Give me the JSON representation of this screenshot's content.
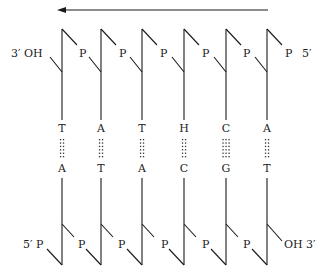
{
  "diagram": {
    "arrow": {
      "direction": "right-to-left",
      "x1": 268,
      "x2": 60,
      "y": 10
    },
    "colors": {
      "ink": "#1a1a1a",
      "background": "#ffffff"
    },
    "top_strand": {
      "left_end_label": "3′ OH",
      "right_end_label": "5′",
      "phosphate_label": "P",
      "phosphates_count": 6,
      "bases": [
        "T",
        "A",
        "T",
        "H",
        "C",
        "A"
      ]
    },
    "bottom_strand": {
      "left_end_label": "5′",
      "right_end_label": "OH 3′",
      "phosphate_label": "P",
      "phosphates_count": 6,
      "bases": [
        "A",
        "T",
        "A",
        "C",
        "G",
        "T"
      ]
    },
    "pairs": [
      {
        "top": "T",
        "bottom": "A",
        "hbonds": 2
      },
      {
        "top": "A",
        "bottom": "T",
        "hbonds": 2
      },
      {
        "top": "T",
        "bottom": "A",
        "hbonds": 2
      },
      {
        "top": "H",
        "bottom": "C",
        "hbonds": 2
      },
      {
        "top": "C",
        "bottom": "G",
        "hbonds": 3
      },
      {
        "top": "A",
        "bottom": "T",
        "hbonds": 2
      }
    ],
    "strand_x": [
      62,
      101,
      142,
      184,
      226,
      267
    ]
  }
}
